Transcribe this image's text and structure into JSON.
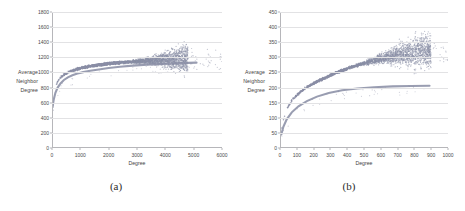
{
  "figure": {
    "panels": [
      {
        "caption": "(a)",
        "chart_data": {
          "type": "scatter",
          "title": "",
          "xlabel": "Degree",
          "ylabel": "Average Neighbor Degree",
          "ylabel_lines": [
            "Average",
            "Neighbor",
            "Degree"
          ],
          "xlim": [
            0,
            6000
          ],
          "ylim": [
            0,
            1800
          ],
          "xticks": [
            0,
            1000,
            2000,
            3000,
            4000,
            5000,
            6000
          ],
          "yticks": [
            0,
            200,
            400,
            600,
            800,
            1000,
            1200,
            1400,
            1600,
            1800
          ],
          "grid": "horizontal",
          "legend": "none",
          "marker_color": "#8b8fa6",
          "series": [
            {
              "name": "scatter-cloud",
              "description": "dense band rising from ~550 at low degree, plateau near 1150, fanning into diffuse cloud between degree 2500 and 4800 reaching up to ~1700",
              "points_x": [
                20,
                40,
                60,
                80,
                100,
                130,
                170,
                210,
                260,
                320,
                380,
                440,
                500,
                560,
                620,
                700,
                800,
                900,
                1000,
                1100,
                1200,
                1350,
                1500,
                1650,
                1800,
                1950,
                2100,
                2250,
                2400,
                2550,
                2700,
                2850,
                3000,
                3150,
                3300,
                3450,
                3600,
                3750,
                3900,
                4050,
                4200,
                4350,
                4500,
                4650,
                4800
              ],
              "points_y": [
                560,
                640,
                700,
                745,
                780,
                820,
                860,
                890,
                915,
                940,
                958,
                972,
                985,
                996,
                1006,
                1018,
                1032,
                1044,
                1054,
                1062,
                1070,
                1080,
                1090,
                1098,
                1105,
                1112,
                1118,
                1123,
                1128,
                1132,
                1136,
                1140,
                1143,
                1146,
                1149,
                1151,
                1153,
                1155,
                1157,
                1158,
                1159,
                1160,
                1161,
                1162,
                1163
              ]
            },
            {
              "name": "lower-curve",
              "description": "smooth monotone curve below the band, plateau near 1130",
              "points_x": [
                20,
                60,
                120,
                200,
                300,
                420,
                560,
                720,
                900,
                1100,
                1350,
                1650,
                2000,
                2400,
                2850,
                3350,
                3900,
                4500,
                5100
              ],
              "points_y": [
                540,
                640,
                730,
                800,
                855,
                900,
                935,
                962,
                985,
                1004,
                1022,
                1040,
                1058,
                1075,
                1090,
                1103,
                1114,
                1124,
                1130
              ]
            }
          ]
        }
      },
      {
        "caption": "(b)",
        "chart_data": {
          "type": "scatter",
          "title": "",
          "xlabel": "Degree",
          "ylabel": "Average Neighbor Degree",
          "ylabel_lines": [
            "Average",
            "Neighbor",
            "Degree"
          ],
          "xlim": [
            0,
            1000
          ],
          "ylim": [
            0,
            450
          ],
          "xticks": [
            0,
            100,
            200,
            300,
            400,
            500,
            600,
            700,
            800,
            900,
            1000
          ],
          "yticks": [
            0,
            50,
            100,
            150,
            200,
            250,
            300,
            350,
            400,
            450
          ],
          "grid": "horizontal",
          "legend": "none",
          "marker_color": "#8b8fa6",
          "series": [
            {
              "name": "scatter-cloud",
              "description": "narrow band near origin widening into a broad cloud between degree 350 and 900, peaking near 370",
              "points_x": [
                8,
                15,
                25,
                35,
                50,
                65,
                80,
                100,
                120,
                140,
                165,
                190,
                215,
                240,
                270,
                300,
                330,
                360,
                395,
                430,
                465,
                500,
                540,
                580,
                620,
                660,
                700,
                740,
                780,
                820,
                860,
                900
              ],
              "points_y": [
                55,
                78,
                100,
                118,
                138,
                152,
                163,
                175,
                185,
                193,
                202,
                210,
                218,
                225,
                232,
                240,
                247,
                254,
                261,
                268,
                274,
                280,
                286,
                291,
                296,
                300,
                304,
                307,
                310,
                312,
                314,
                316
              ]
            },
            {
              "name": "lower-curve",
              "description": "smooth monotone curve plateauing near 205",
              "points_x": [
                8,
                20,
                40,
                70,
                110,
                160,
                220,
                290,
                370,
                460,
                560,
                670,
                780,
                890
              ],
              "points_y": [
                45,
                70,
                95,
                118,
                138,
                155,
                170,
                182,
                191,
                197,
                201,
                204,
                205,
                206
              ]
            }
          ]
        }
      }
    ]
  }
}
